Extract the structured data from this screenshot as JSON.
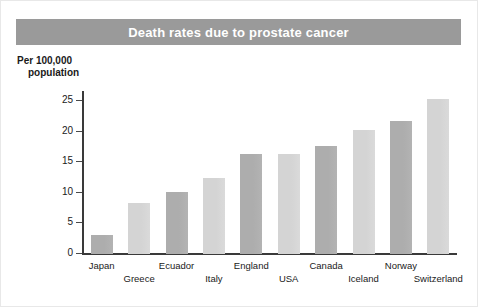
{
  "chart_data": {
    "type": "bar",
    "title": "Death rates due to prostate cancer",
    "ylabel": "Per 100,000 population",
    "ylabel_line1": "Per 100,000",
    "ylabel_line2": "population",
    "xlabel": "",
    "categories": [
      "Japan",
      "Greece",
      "Ecuador",
      "Italy",
      "England",
      "USA",
      "Canada",
      "Iceland",
      "Norway",
      "Switzerland"
    ],
    "values": [
      3.1,
      8.3,
      10.2,
      12.4,
      16.3,
      16.4,
      17.7,
      20.3,
      21.7,
      25.3
    ],
    "ylim": [
      0,
      26.5
    ],
    "yticks": [
      0,
      5,
      10,
      15,
      20,
      25
    ],
    "ytick_labels": [
      "0",
      "5",
      "10",
      "15",
      "20",
      "25"
    ],
    "grid": false,
    "legend": null,
    "bar_colors": [
      "#adadad",
      "#d4d4d4",
      "#adadad",
      "#d4d4d4",
      "#adadad",
      "#d4d4d4",
      "#adadad",
      "#d4d4d4",
      "#adadad",
      "#d4d4d4"
    ],
    "label_rows": [
      "top",
      "bottom",
      "top",
      "bottom",
      "top",
      "bottom",
      "top",
      "bottom",
      "top",
      "bottom"
    ]
  },
  "style": {
    "title_band_color": "#9a9a9a",
    "title_text_color": "#ffffff",
    "axis_color": "#3a3a3a",
    "text_color": "#1a1a1a",
    "background": "#ffffff"
  }
}
